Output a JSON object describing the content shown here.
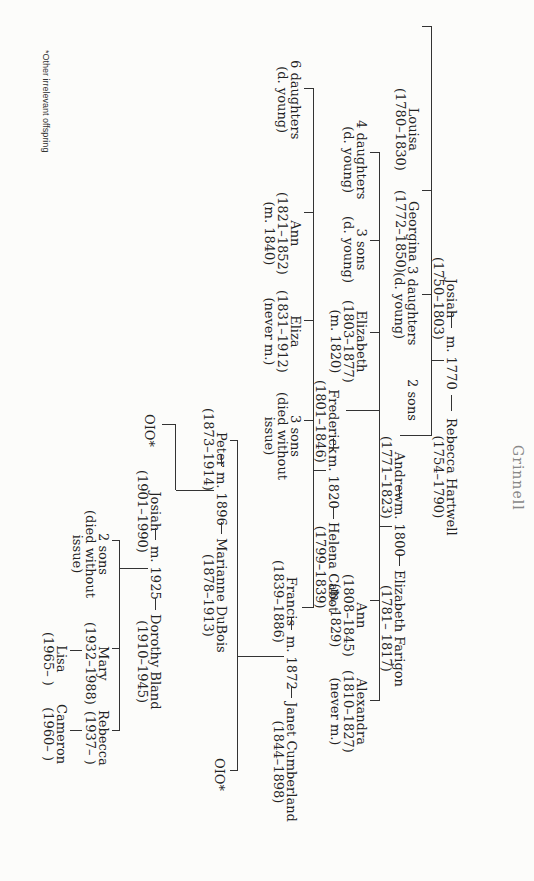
{
  "title_fragment": "Grinnell",
  "footnote": "*Other irrelevant offspring",
  "generation1": {
    "husband": {
      "name": "Josiah",
      "dates": "(1750–1803)"
    },
    "marriage": "m. 1770",
    "wife": {
      "name": "Rebecca Hartwell",
      "dates": "(1754–1790)"
    },
    "children": [
      {
        "name": "Louisa",
        "dates": "(1780–1830)"
      },
      {
        "name": "Georgina",
        "dates": "(1772–1850)"
      },
      {
        "name": "3 daughters",
        "note": "(d. young)"
      },
      {
        "name": "2 sons"
      },
      {
        "name": "Andrew",
        "dates": "(1771–1823)"
      }
    ]
  },
  "generation2": {
    "husband": {
      "name": "Andrew",
      "dates": "(1771–1823)"
    },
    "marriage": "m. 1800",
    "wife": {
      "name": "Elizabeth Farigon",
      "dates": "(1781– 1817)"
    },
    "children": [
      {
        "name": "4 daughters",
        "note": "(d. young)"
      },
      {
        "name": "3 sons",
        "note": "(d. young)"
      },
      {
        "name": "Elizabeth",
        "dates": "(1803–1877)",
        "note": "(m. 1820)"
      },
      {
        "name": "Frederick",
        "dates": "(1801–1846)"
      },
      {
        "name": "Ann",
        "dates": "(1808–1845)",
        "note": "(m. 1829)"
      },
      {
        "name": "Alexandra",
        "dates": "(1810–1827)",
        "note": "(never m.)"
      }
    ]
  },
  "generation3": {
    "husband": {
      "name": "Frederick",
      "dates": "(1801–1846)"
    },
    "marriage": "m. 1820",
    "wife": {
      "name": "Helena Cabot",
      "dates": "(1799–1839)"
    },
    "children": [
      {
        "name": "6 daughters",
        "note": "(d. young)"
      },
      {
        "name": "Ann",
        "dates": "(1821–1852)",
        "note": "(m. 1840)"
      },
      {
        "name": "Eliza",
        "dates": "(1831–1912)",
        "note": "(never m.)"
      },
      {
        "name": "3 sons",
        "note1": "(died without",
        "note2": "issue)"
      },
      {
        "name": "Francis",
        "dates": "(1839–1886)"
      }
    ]
  },
  "generation4": {
    "husband": {
      "name": "Francis",
      "dates": "(1839–1886)"
    },
    "marriage": "m. 1872",
    "wife": {
      "name": "Janet Cumberland",
      "dates": "(1844–1898)"
    },
    "children": [
      {
        "name": "Peter",
        "dates": "(1873–1914)"
      },
      {
        "name": "OIO*"
      }
    ]
  },
  "generation5": {
    "husband": {
      "name": "Peter",
      "dates": "(1873–1914)"
    },
    "marriage": "m. 1896",
    "wife": {
      "name": "Marianne DuBois",
      "dates": "(1878–1913)"
    },
    "children": [
      {
        "name": "OIO*"
      },
      {
        "name": "Josiah",
        "dates": "(1901–1990)"
      }
    ]
  },
  "generation6": {
    "husband": {
      "name": "Josiah",
      "dates": "(1901–1990)"
    },
    "marriage": "m. 1925",
    "wife": {
      "name": "Dorothy Bland",
      "dates": "(1910–1945)"
    },
    "children": [
      {
        "name": "2 sons",
        "note1": "(died without",
        "note2": "issue)"
      },
      {
        "name": "Mary",
        "dates": "(1932–1988)"
      },
      {
        "name": "Rebecca",
        "dates": "(1937– )"
      }
    ]
  },
  "generation7": [
    {
      "parent": "Mary",
      "name": "Lisa",
      "dates": "(1965– )"
    },
    {
      "parent": "Rebecca",
      "name": "Cameron",
      "dates": "(1960– )"
    }
  ]
}
